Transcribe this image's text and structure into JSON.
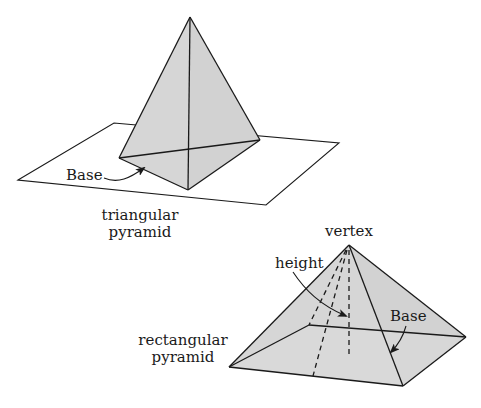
{
  "colors": {
    "face_fill": "#d6d6d6",
    "line": "#1a1a1a",
    "background": "#ffffff"
  },
  "triangular_pyramid": {
    "label_line1": "triangular",
    "label_line2": "pyramid",
    "base_label": "Base"
  },
  "rectangular_pyramid": {
    "label_line1": "rectangular",
    "label_line2": "pyramid",
    "vertex_label": "vertex",
    "height_label": "height",
    "base_label": "Base"
  }
}
